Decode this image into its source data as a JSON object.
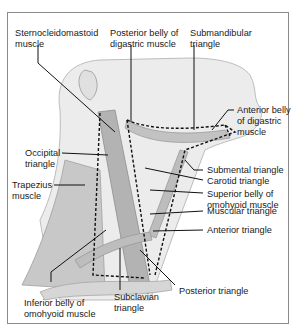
{
  "figure": {
    "labels": {
      "sternocleidomastoid": "Sternocleidomastoid\nmuscle",
      "posterior_digastric": "Posterior belly of\ndigastric muscle",
      "submandibular": "Submandibular\ntriangle",
      "anterior_digastric": "Anterior belly\nof digastric\nmuscle",
      "occipital": "Occipital\ntriangle",
      "trapezius": "Trapezius\nmuscle",
      "submental": "Submental triangle",
      "carotid": "Carotid triangle",
      "superior_omohyoid": "Superior belly of\nomohyoid muscle",
      "muscular": "Muscular triangle",
      "anterior": "Anterior triangle",
      "posterior": "Posterior triangle",
      "inferior_omohyoid": "Inferior belly of\nomohyoid muscle",
      "subclavian": "Subclavian\ntriangle"
    },
    "colors": {
      "frame": "#8a8a8a",
      "skin": "#e4e4e4",
      "muscle": "#b9b9b9",
      "muscle_dark": "#9d9d9d",
      "leader": "#111111"
    }
  }
}
